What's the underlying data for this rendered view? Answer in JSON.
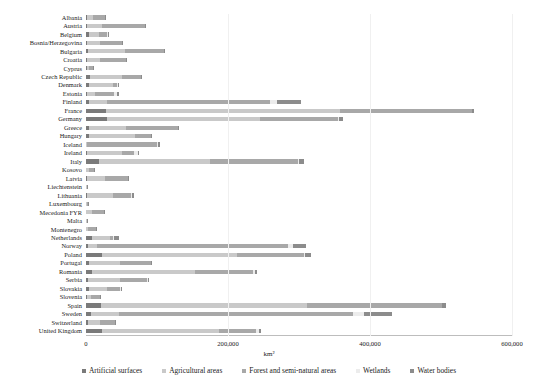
{
  "chart_data": {
    "type": "bar",
    "orientation": "horizontal",
    "stacked": true,
    "title": "",
    "xlabel": "km²",
    "ylabel": "",
    "xlim": [
      0,
      600000
    ],
    "xticks": [
      0,
      200000,
      400000,
      600000
    ],
    "xtick_labels": [
      "0",
      "200,000",
      "400,000",
      "600,000"
    ],
    "grid": "vertical-only",
    "legend_position": "bottom",
    "categories": [
      "Albania",
      "Austria",
      "Belgium",
      "Bosnia/Herzegovina",
      "Bulgaria",
      "Croatia",
      "Cyprus",
      "Czech Republic",
      "Denmark",
      "Estonia",
      "Finland",
      "France",
      "Germany",
      "Greece",
      "Hungary",
      "Iceland",
      "Ireland",
      "Italy",
      "Kosovo",
      "Latvia",
      "Liechtenstein",
      "Lithuania",
      "Luxembourg",
      "Mecedonia FYR",
      "Malta",
      "Montenegro",
      "Netherlands",
      "Norway",
      "Poland",
      "Portugal",
      "Romania",
      "Serbia",
      "Slovakia",
      "Slovenia",
      "Spain",
      "Sweden",
      "Switzerland",
      "United Kingdom"
    ],
    "series": [
      {
        "name": "Artificial surfaces",
        "color": "#7a7a7a",
        "values": [
          900,
          2100,
          4100,
          1600,
          3000,
          1900,
          900,
          5100,
          4400,
          1500,
          4600,
          28000,
          30000,
          3900,
          4600,
          300,
          2100,
          19000,
          400,
          1500,
          10,
          2000,
          300,
          700,
          100,
          300,
          8500,
          3100,
          22000,
          4600,
          8000,
          3200,
          3600,
          1100,
          21000,
          6500,
          3400,
          23000
        ]
      },
      {
        "name": "Agricultural areas",
        "color": "#c9c9c9",
        "values": [
          9000,
          21000,
          14000,
          18000,
          52000,
          18000,
          3400,
          45000,
          34000,
          11000,
          25000,
          330000,
          215000,
          52000,
          65000,
          1500,
          48000,
          155000,
          4300,
          25000,
          50,
          36000,
          1200,
          8000,
          100,
          2600,
          25000,
          12000,
          190000,
          43000,
          145000,
          45000,
          26000,
          6500,
          290000,
          40000,
          16000,
          165000
        ]
      },
      {
        "name": "Forest and semi-natural areas",
        "color": "#a8a8a8",
        "values": [
          17000,
          60000,
          12000,
          31000,
          55000,
          36000,
          5000,
          27000,
          5500,
          27000,
          230000,
          185000,
          110000,
          73000,
          22000,
          98000,
          17000,
          125000,
          6000,
          32000,
          140,
          26000,
          1100,
          16000,
          100,
          10500,
          4500,
          270000,
          95000,
          44000,
          82000,
          38000,
          19000,
          12000,
          190000,
          330000,
          21000,
          52000
        ]
      },
      {
        "name": "Wetlands",
        "color": "#ececec",
        "values": [
          200,
          100,
          400,
          100,
          200,
          200,
          50,
          100,
          600,
          4500,
          9000,
          1200,
          2000,
          300,
          200,
          1100,
          5500,
          300,
          30,
          800,
          5,
          500,
          20,
          100,
          10,
          50,
          1200,
          6500,
          2000,
          300,
          2600,
          300,
          200,
          50,
          400,
          15000,
          100,
          3500
        ]
      },
      {
        "name": "Water bodies",
        "color": "#8c8c8c",
        "values": [
          1200,
          400,
          400,
          300,
          1500,
          600,
          150,
          800,
          1100,
          2500,
          34000,
          2800,
          4500,
          1700,
          1200,
          2500,
          1300,
          7000,
          100,
          1500,
          10,
          2500,
          60,
          600,
          10,
          300,
          7500,
          19000,
          7500,
          1500,
          2800,
          700,
          500,
          200,
          5500,
          39000,
          1400,
          3200
        ]
      }
    ]
  },
  "legend": {
    "items": [
      {
        "label": "Artificial surfaces",
        "color": "#7a7a7a"
      },
      {
        "label": "Agricultural areas",
        "color": "#c9c9c9"
      },
      {
        "label": "Forest and semi-natural areas",
        "color": "#a8a8a8"
      },
      {
        "label": "Wetlands",
        "color": "#ececec"
      },
      {
        "label": "Water bodies",
        "color": "#8c8c8c"
      }
    ]
  }
}
